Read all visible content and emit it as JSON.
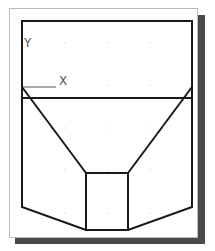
{
  "viewport": {
    "frame": {
      "x": 9,
      "y": 8,
      "w": 188,
      "h": 229,
      "border": "#bbbbbb",
      "bg": "#ffffff"
    },
    "shadow": {
      "color": "#4a4a4a",
      "offset": 8
    },
    "grid": {
      "xs": [
        22,
        65,
        107,
        150,
        192
      ],
      "ys": [
        43,
        85,
        128,
        170,
        213
      ],
      "color": "#bbbbbb"
    }
  },
  "ucs_icon": {
    "x_label": "X",
    "y_label": "Y"
  },
  "drawing": {
    "stroke": "#1a1a1a",
    "outline": [
      [
        22,
        21
      ],
      [
        192,
        21
      ],
      [
        192,
        207
      ],
      [
        128,
        230
      ],
      [
        86,
        230
      ],
      [
        22,
        207
      ]
    ],
    "horizontal_line": [
      [
        22,
        98
      ],
      [
        192,
        98
      ]
    ],
    "left_diagonal": [
      [
        22,
        87
      ],
      [
        86,
        173
      ]
    ],
    "right_diagonal": [
      [
        192,
        87
      ],
      [
        128,
        173
      ]
    ],
    "box": {
      "x": 86,
      "y": 173,
      "w": 42,
      "h": 57
    }
  }
}
